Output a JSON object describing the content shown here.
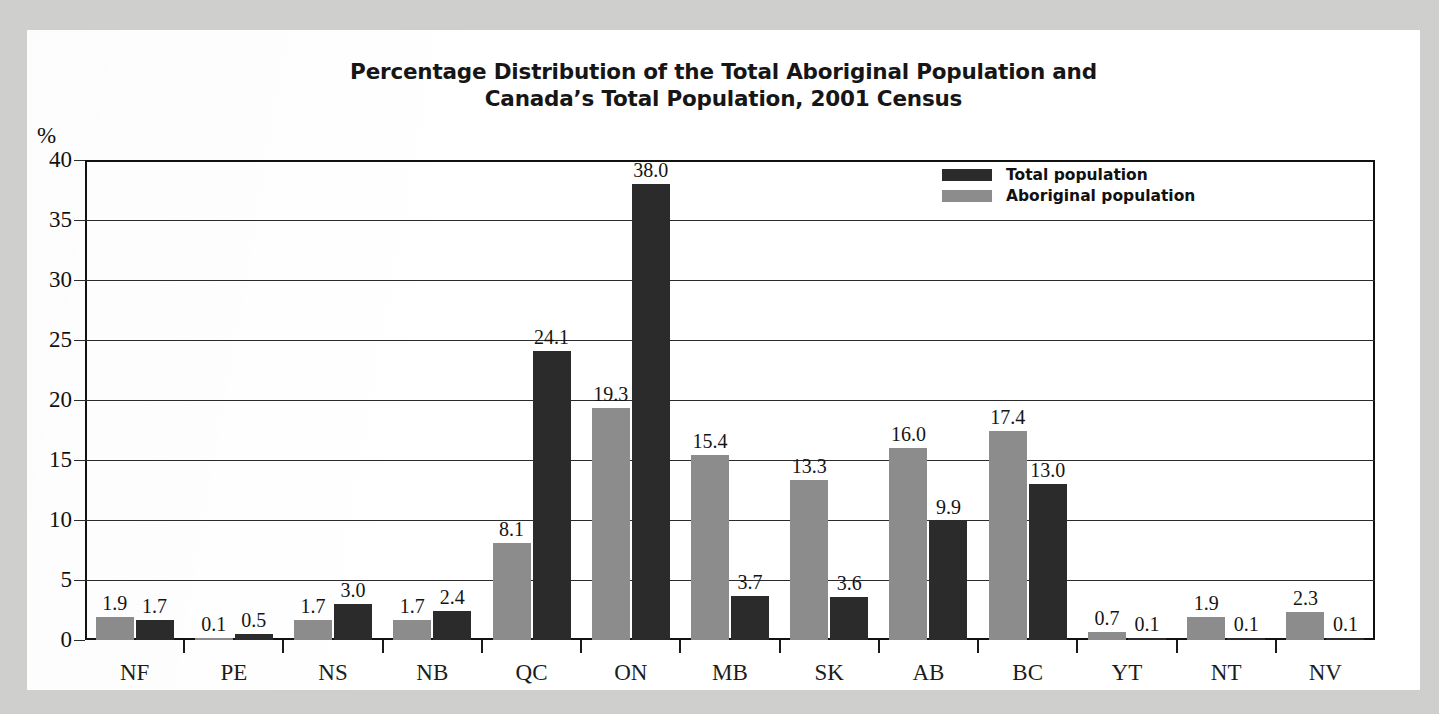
{
  "chart_data": {
    "type": "bar",
    "title_line1": "Percentage Distribution of the Total Aboriginal Population and",
    "title_line2": "Canada’s Total Population, 2001 Census",
    "xlabel": "",
    "ylabel": "%",
    "ylim": [
      0,
      40
    ],
    "yticks": [
      0,
      5,
      10,
      15,
      20,
      25,
      30,
      35,
      40
    ],
    "ytick_labels": [
      "0",
      "5",
      "10",
      "15",
      "20",
      "25",
      "30",
      "35",
      "40"
    ],
    "grid": true,
    "legend_position": "top-right",
    "categories": [
      "NF",
      "PE",
      "NS",
      "NB",
      "QC",
      "ON",
      "MB",
      "SK",
      "AB",
      "BC",
      "YT",
      "NT",
      "NV"
    ],
    "series": [
      {
        "name": "Aboriginal population",
        "color": "#8c8c8c",
        "values": [
          1.9,
          0.1,
          1.7,
          1.7,
          8.1,
          19.3,
          15.4,
          13.3,
          16.0,
          17.4,
          0.7,
          1.9,
          2.3
        ],
        "labels": [
          "1.9",
          "0.1",
          "1.7",
          "1.7",
          "8.1",
          "19.3",
          "15.4",
          "13.3",
          "16.0",
          "17.4",
          "0.7",
          "1.9",
          "2.3"
        ]
      },
      {
        "name": "Total population",
        "color": "#2b2b2b",
        "values": [
          1.7,
          0.5,
          3.0,
          2.4,
          24.1,
          38.0,
          3.7,
          3.6,
          9.9,
          13.0,
          0.1,
          0.1,
          0.1
        ],
        "labels": [
          "1.7",
          "0.5",
          "3.0",
          "2.4",
          "24.1",
          "38.0",
          "3.7",
          "3.6",
          "9.9",
          "13.0",
          "0.1",
          "0.1",
          "0.1"
        ]
      }
    ],
    "legend": [
      {
        "label": "Total population",
        "color": "#2b2b2b",
        "key": "total"
      },
      {
        "label": "Aboriginal population",
        "color": "#8c8c8c",
        "key": "aboriginal"
      }
    ]
  }
}
